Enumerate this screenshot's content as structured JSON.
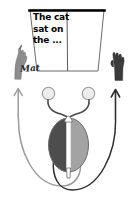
{
  "figure": {
    "screen": {
      "name": "stimulus-screen",
      "text": "The cat\nsat on\nthe ...",
      "lines": [
        "The cat",
        "sat on",
        "the ..."
      ],
      "divider": "vertical-midline-divider",
      "border_color": "#000000",
      "fill_color": "#ffffff"
    },
    "response": {
      "name": "handwritten-response",
      "text": "Mat"
    },
    "hands": [
      {
        "side": "left",
        "name": "left-hand",
        "color": "#8d8d8d",
        "label": "left hand writing"
      },
      {
        "side": "right",
        "name": "right-hand",
        "color": "#3a3a3a",
        "label": "right hand raised"
      }
    ],
    "arrows": [
      {
        "side": "left",
        "name": "left-pathway-arrow",
        "color": "#9a9a9a",
        "direction": "up"
      },
      {
        "side": "right",
        "name": "right-pathway-arrow",
        "color": "#2e2e2e",
        "direction": "up"
      }
    ],
    "brain": {
      "name": "brain-body-figure",
      "left_half_color": "#4d4d4d",
      "right_half_color": "#a3a3a3",
      "midline_color": "#ffffff",
      "outline_color": "#6a6a6a"
    },
    "eyes": [
      {
        "name": "left-eye",
        "fill": "#ededed",
        "stroke": "#9a9a9a"
      },
      {
        "name": "right-eye",
        "fill": "#ededed",
        "stroke": "#9a9a9a"
      }
    ],
    "optic_tracts": {
      "name": "optic-nerve-tracts",
      "color": "#4a4a4a"
    },
    "colors": {
      "background": "#ffffff",
      "ink": "#000000",
      "light_gray": "#a3a3a3",
      "dark_gray": "#4d4d4d"
    }
  }
}
